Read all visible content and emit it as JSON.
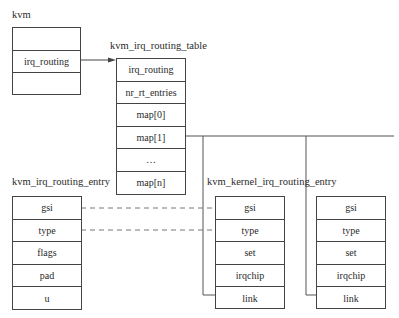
{
  "kvm": {
    "title": "kvm",
    "fields": [
      "",
      "irq_routing",
      ""
    ]
  },
  "routing_table": {
    "title": "kvm_irq_routing_table",
    "fields": [
      "irq_routing",
      "nr_rt_entries",
      "map[0]",
      "map[1]",
      "…",
      "map[n]"
    ]
  },
  "routing_entry": {
    "title": "kvm_irq_routing_entry",
    "fields": [
      "gsi",
      "type",
      "flags",
      "pad",
      "u"
    ]
  },
  "kernel_entry": {
    "title": "kvm_kernel_irq_routing_entry",
    "fields": [
      "gsi",
      "type",
      "set",
      "irqchip",
      "link"
    ]
  },
  "kernel_entry_2": {
    "fields": [
      "gsi",
      "type",
      "set",
      "irqchip",
      "link"
    ]
  },
  "colors": {
    "line": "#444444",
    "text": "#2a2a2a"
  }
}
